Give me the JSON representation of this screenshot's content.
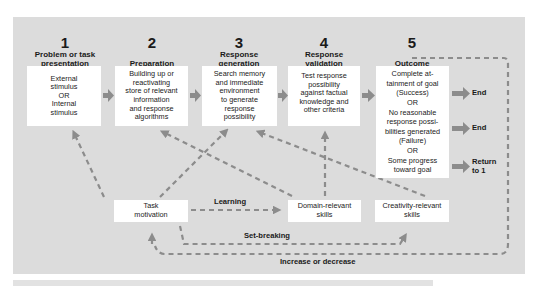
{
  "diagram": {
    "stages": [
      {
        "number": "1",
        "title_line1": "Problem or task",
        "title_line2": "presentation",
        "box_lines": [
          "External",
          "stimulus",
          "OR",
          "Internal",
          "stimulus"
        ]
      },
      {
        "number": "2",
        "title_line1": "",
        "title_line2": "Preparation",
        "box_lines": [
          "Building up or",
          "reactivating",
          "store of relevant",
          "information",
          "and response",
          "algorithms"
        ]
      },
      {
        "number": "3",
        "title_line1": "Response",
        "title_line2": "generation",
        "box_lines": [
          "Search memory",
          "and immediate",
          "environment",
          "to generate",
          "response",
          "possibility"
        ]
      },
      {
        "number": "4",
        "title_line1": "Response",
        "title_line2": "validation",
        "box_lines": [
          "Test response",
          "possibility",
          "against factual",
          "knowledge and",
          "other criteria"
        ]
      },
      {
        "number": "5",
        "title_line1": "",
        "title_line2": "Outcome",
        "box_lines": [
          "Complete at-",
          "tainment of goal",
          "(Success)",
          "OR",
          "No reasonable",
          "response possi-",
          "bilities generated",
          "(Failure)",
          "OR",
          "Some progress",
          "toward goal"
        ]
      }
    ],
    "outcomes": {
      "success_result": "End",
      "failure_result": "End",
      "progress_result_line1": "Return",
      "progress_result_line2": "to 1"
    },
    "components": {
      "task_motivation": [
        "Task",
        "motivation"
      ],
      "domain_skills": [
        "Domain-relevant",
        "skills"
      ],
      "creativity_skills": [
        "Creativity-relevant",
        "skills"
      ]
    },
    "link_labels": {
      "learning": "Learning",
      "set_breaking": "Set-breaking",
      "increase_decrease": "Increase or decrease"
    },
    "colors": {
      "panel": "#dcdcdc",
      "box": "#ffffff",
      "arrow": "#8c8c8c"
    }
  }
}
